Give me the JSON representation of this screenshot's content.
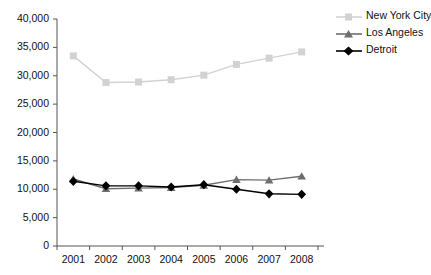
{
  "chart_data": {
    "type": "line",
    "title": "",
    "subtitle": "",
    "xlabel": "",
    "ylabel": "",
    "categories": [
      "2001",
      "2002",
      "2003",
      "2004",
      "2005",
      "2006",
      "2007",
      "2008"
    ],
    "ylim": [
      0,
      40000
    ],
    "yticks": [
      "0",
      "5,000",
      "10,000",
      "15,000",
      "20,000",
      "25,000",
      "30,000",
      "35,000",
      "40,000"
    ],
    "ytick_values": [
      0,
      5000,
      10000,
      15000,
      20000,
      25000,
      30000,
      35000,
      40000
    ],
    "grid": false,
    "legend_position": "top-right",
    "series": [
      {
        "name": "New York City",
        "marker": "square",
        "color": "#d2d2d2",
        "values": [
          33500,
          28800,
          28900,
          29300,
          30100,
          32000,
          33100,
          34200
        ]
      },
      {
        "name": "Los Angeles",
        "marker": "triangle",
        "color": "#6e6e6e",
        "values": [
          11800,
          10100,
          10200,
          10300,
          10700,
          11700,
          11600,
          12300
        ]
      },
      {
        "name": "Detroit",
        "marker": "diamond",
        "color": "#000000",
        "values": [
          11400,
          10600,
          10600,
          10400,
          10800,
          10000,
          9200,
          9100
        ]
      }
    ]
  },
  "axis": {
    "line_color": "#555555",
    "tick_color": "#555555"
  }
}
